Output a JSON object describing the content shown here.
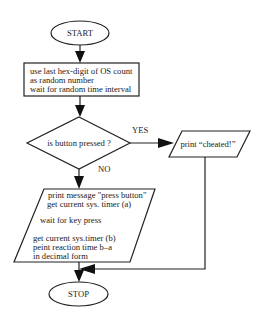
{
  "diagram": {
    "type": "flowchart",
    "nodes": {
      "start": {
        "label": "START",
        "shape": "ellipse"
      },
      "init": {
        "shape": "rectangle",
        "lines": [
          "use last hex-digit of OS count",
          "as random number",
          "wait for random time interval"
        ]
      },
      "decision": {
        "label": "is button pressed ?",
        "shape": "diamond"
      },
      "cheated": {
        "label": "print “cheated!”",
        "shape": "parallelogram"
      },
      "measure": {
        "shape": "parallelogram",
        "lines": [
          "print message \"press button\"",
          "get current sys. timer (a)",
          "wait for key press",
          "get current sys.timer (b)",
          "peint reaction time b–a",
          "in decimal form"
        ]
      },
      "stop": {
        "label": "STOP",
        "shape": "ellipse"
      }
    },
    "edges": {
      "yes_label": "YES",
      "no_label": "NO"
    }
  }
}
